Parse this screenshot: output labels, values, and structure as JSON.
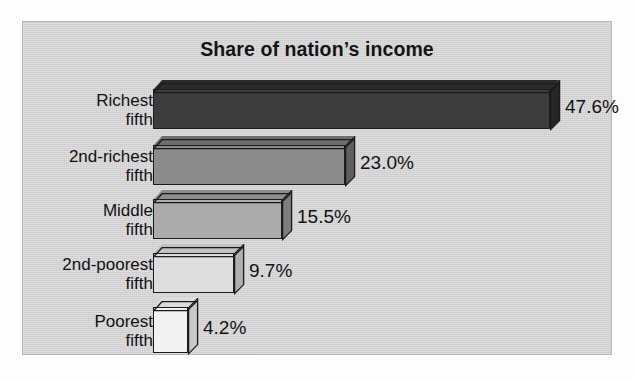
{
  "chart_data": {
    "type": "bar",
    "orientation": "horizontal",
    "title": "Share of nation’s income",
    "xlabel": "",
    "ylabel": "",
    "grid": false,
    "legend": false,
    "xlim": [
      0,
      50
    ],
    "categories": [
      "Richest\nfifth",
      "2nd-richest\nfifth",
      "Middle\nfifth",
      "2nd-poorest\nfifth",
      "Poorest\nfifth"
    ],
    "values": [
      47.6,
      23.0,
      15.5,
      9.7,
      4.2
    ],
    "value_labels": [
      "47.6%",
      "23.0%",
      "15.5%",
      "9.7%",
      "4.2%"
    ],
    "bar_colors": [
      "#3c3c3c",
      "#8c8c8c",
      "#ababab",
      "#dedede",
      "#f2f2f2"
    ],
    "bar_top_colors": [
      "#2a2a2a",
      "#6e6e6e",
      "#8e8e8e",
      "#c2c2c2",
      "#dcdcdc"
    ],
    "bar_side_colors": [
      "#262626",
      "#5e5e5e",
      "#7d7d7d",
      "#b0b0b0",
      "#c9c9c9"
    ],
    "background_color": "#d4d4d4",
    "border_color": "#b6b6b6",
    "text_color": "#121212"
  }
}
